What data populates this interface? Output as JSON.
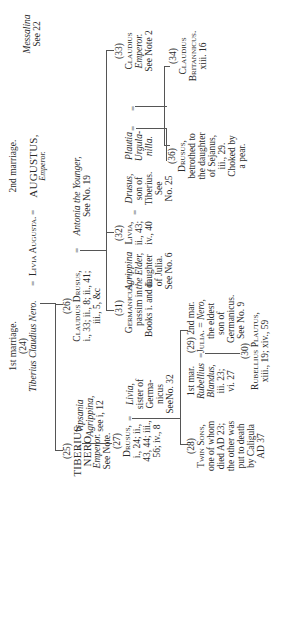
{
  "top": {
    "marriage1_label": "1st marriage.",
    "marriage1_num": "(24)",
    "marriage1_name": "Tiberius Claudius Nero.",
    "livia": "Livia Augusta.",
    "marriage2_label": "2nd marriage.",
    "augustus": "AUGUSTUS,",
    "augustus_title": "Emperor."
  },
  "nodes": {
    "n25": {
      "num": "(25)",
      "name1": "TIBERIUS",
      "name2": "NERO",
      "title": "Emperor.",
      "note": "See Note."
    },
    "vipsania": {
      "l1": "Vipsania",
      "l2": "Agrippina,",
      "l3": "see i, 12"
    },
    "n27": {
      "num": "(27)",
      "name": "Drusus,",
      "l1": "i., 24; ii.,",
      "l2": "43, 44; iii.,",
      "l3": "56; iv., 8"
    },
    "livia_sister": {
      "l1": "Livia,",
      "l2": "sister of",
      "l3": "Germa-",
      "l4": "nicus",
      "l5": "SeeNo. 32"
    },
    "n28": {
      "num": "(28)",
      "l1": "Twin Sons,",
      "l2": "one of whom",
      "l3": "died AD 23;",
      "l4": "the other was",
      "l5": "put to death",
      "l6": "by Caligula",
      "l7": "AD 37"
    },
    "rubellius": {
      "mar": "1st mar.",
      "l1": "Rubellius",
      "l2": "Blandus,",
      "l3": "iii. 23;",
      "l4": "vi. 27"
    },
    "n29": {
      "num": "(29)",
      "mar": "2nd mar.",
      "name": "Julia.",
      "l1": "Nero,",
      "l2": "the eldest",
      "l3": "son of",
      "l4": "Germanicus.",
      "l5": "See No. 9"
    },
    "n30": {
      "num": "(30)",
      "name": "Rubellius Plautus,",
      "l1": "xiii., 19; xiv., 59"
    },
    "n26": {
      "num": "(26)",
      "name": "Claudius Drusus,",
      "l1": "i., 33; ii., 8; ii., 41;",
      "l2": "iii., 5, &c"
    },
    "antonia": {
      "l1": "Antonia the Younger,",
      "l2": "See No. 19"
    },
    "n31": {
      "num": "(31)",
      "name": "Germanicus,",
      "l1": "passim in",
      "l2": "Books i. and ii."
    },
    "agrippina": {
      "l1": "Agrippina",
      "l2": "the Elder,",
      "l3": "daughter",
      "l4": "of Julia.",
      "l5": "See No. 6"
    },
    "n32": {
      "num": "(32)",
      "name": "Livia,",
      "l1": "ii., 43;",
      "l2": "iv., 40"
    },
    "drusus_t": {
      "l1": "Drusus,",
      "l2": "son of",
      "l3": "Tiberius.",
      "l4": "See",
      "l5": "No. 25"
    },
    "n33": {
      "num": "(33)",
      "name": "Claudius",
      "title": "Emperor.",
      "note": "See Note 2"
    },
    "plautia": {
      "l1": "Plautia",
      "l2": "Urgula-",
      "l3": "nilla."
    },
    "n36": {
      "num": "(36)",
      "name": "Drusus,",
      "l1": "betrothed to",
      "l2": "the daughter",
      "l3": "of Sejanus,",
      "l4": "iii., 29.",
      "l5": "Choked by",
      "l6": "a pear."
    },
    "messalina": {
      "l1": "Messalina",
      "l2": "See 22"
    },
    "n34": {
      "num": "(34)",
      "name1": "Claudius",
      "name2": "Britannicus.",
      "l1": "xiii. 16"
    },
    "n35": {
      "num": "(35)",
      "name": "Octavia."
    },
    "nero": {
      "l1": "Nero,",
      "l2": "Emperor.",
      "l3": "See",
      "l4": "No. 15"
    }
  },
  "symbols": {
    "eq": "="
  }
}
